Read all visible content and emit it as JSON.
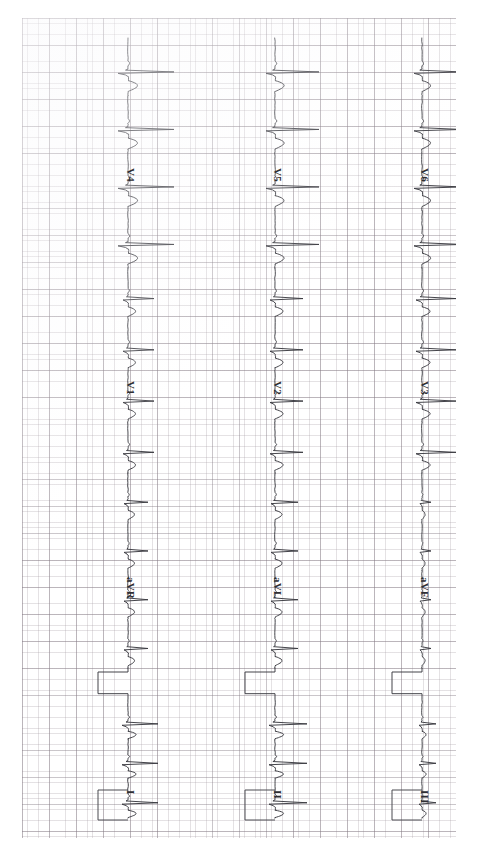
{
  "document": {
    "type": "ecg-strip",
    "title": "12-Lead Electrocardiogram",
    "orientation": "rotated-90-clockwise",
    "paper": {
      "background_color": "#ffffff",
      "small_grid_color": "#a0969e",
      "bold_grid_color": "#827882",
      "small_grid_px": 5.42,
      "bold_grid_px": 27.1
    },
    "trace_color": "#3a3a40"
  },
  "columns": [
    {
      "name": "column-1",
      "baseline_x": 128,
      "leads": [
        {
          "label": "V4",
          "label_x": 136,
          "label_y": 168
        },
        {
          "label": "V1",
          "label_x": 136,
          "label_y": 381
        },
        {
          "label": "aVR",
          "label_x": 136,
          "label_y": 577
        },
        {
          "label": "I",
          "label_x": 136,
          "label_y": 790
        }
      ]
    },
    {
      "name": "column-2",
      "baseline_x": 275,
      "leads": [
        {
          "label": "V5",
          "label_x": 283,
          "label_y": 168
        },
        {
          "label": "V2",
          "label_x": 283,
          "label_y": 381
        },
        {
          "label": "aVL",
          "label_x": 283,
          "label_y": 577
        },
        {
          "label": "II",
          "label_x": 283,
          "label_y": 790
        }
      ]
    },
    {
      "name": "column-3",
      "baseline_x": 422,
      "leads": [
        {
          "label": "V6",
          "label_x": 430,
          "label_y": 168
        },
        {
          "label": "V3",
          "label_x": 430,
          "label_y": 381
        },
        {
          "label": "aVF",
          "label_x": 430,
          "label_y": 577
        },
        {
          "label": "III",
          "label_x": 430,
          "label_y": 790
        }
      ]
    }
  ],
  "chart_data": {
    "type": "line",
    "subtitle": "",
    "xlabel": "Time",
    "ylabel": "Amplitude (mV)",
    "grid": true,
    "legend_position": "inline-right-of-trace",
    "paper_speed_mm_per_s": 25,
    "gain_mm_per_mV": 10,
    "series": [
      {
        "name": "V4",
        "column": 1,
        "order": 1,
        "qrs_beats": 4,
        "qrs_amplitude_mm": 16,
        "polarity": "positive"
      },
      {
        "name": "V1",
        "column": 1,
        "order": 2,
        "qrs_beats": 4,
        "qrs_amplitude_mm": 8,
        "polarity": "positive"
      },
      {
        "name": "aVR",
        "column": 1,
        "order": 3,
        "qrs_beats": 4,
        "qrs_amplitude_mm": 6,
        "polarity": "negative"
      },
      {
        "name": "I",
        "column": 1,
        "order": 4,
        "qrs_beats": 3,
        "qrs_amplitude_mm": 9,
        "polarity": "positive"
      },
      {
        "name": "V5",
        "column": 2,
        "order": 1,
        "qrs_beats": 4,
        "qrs_amplitude_mm": 15,
        "polarity": "positive"
      },
      {
        "name": "V2",
        "column": 2,
        "order": 2,
        "qrs_beats": 4,
        "qrs_amplitude_mm": 9,
        "polarity": "positive"
      },
      {
        "name": "aVL",
        "column": 2,
        "order": 3,
        "qrs_beats": 4,
        "qrs_amplitude_mm": 7,
        "polarity": "positive"
      },
      {
        "name": "II",
        "column": 2,
        "order": 4,
        "qrs_beats": 3,
        "qrs_amplitude_mm": 10,
        "polarity": "positive"
      },
      {
        "name": "V6",
        "column": 3,
        "order": 1,
        "qrs_beats": 4,
        "qrs_amplitude_mm": 13,
        "polarity": "positive"
      },
      {
        "name": "V3",
        "column": 3,
        "order": 2,
        "qrs_beats": 4,
        "qrs_amplitude_mm": 11,
        "polarity": "positive"
      },
      {
        "name": "aVF",
        "column": 3,
        "order": 3,
        "qrs_beats": 4,
        "qrs_amplitude_mm": 3,
        "polarity": "low-voltage"
      },
      {
        "name": "III",
        "column": 3,
        "order": 4,
        "qrs_beats": 3,
        "qrs_amplitude_mm": 5,
        "polarity": "biphasic"
      }
    ],
    "calibration": {
      "label": "1 mV calibration pulse",
      "height_mm": 10,
      "width_mm": 5,
      "present_in_columns": [
        1,
        2,
        3
      ]
    }
  }
}
